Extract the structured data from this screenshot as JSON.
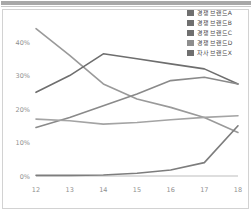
{
  "chart_data": {
    "type": "line",
    "title": "",
    "xlabel": "",
    "ylabel": "",
    "categories": [
      "12",
      "13",
      "14",
      "15",
      "16",
      "17",
      "18"
    ],
    "x_tick_labels": [
      "12",
      "13",
      "14",
      "15",
      "16",
      "17",
      "18"
    ],
    "y_tick_labels": [
      "0%",
      "10%",
      "20%",
      "30%",
      "40%"
    ],
    "y_tick_values": [
      0,
      10,
      20,
      30,
      40
    ],
    "ylim": [
      0,
      46
    ],
    "xlim": [
      12,
      18
    ],
    "grid": false,
    "legend_position": "top-right",
    "series": [
      {
        "name": "경쟁 브랜드A",
        "color": "#9a9a9a",
        "values": [
          44.0,
          36.0,
          27.5,
          23.0,
          20.5,
          17.5,
          13.0
        ]
      },
      {
        "name": "경쟁 브랜드B",
        "color": "#6e6e6e",
        "values": [
          25.0,
          30.0,
          36.5,
          35.0,
          33.5,
          32.0,
          27.5
        ]
      },
      {
        "name": "경쟁 브랜드C",
        "color": "#8a8a8a",
        "values": [
          14.5,
          17.5,
          21.0,
          24.5,
          28.5,
          29.5,
          27.5
        ]
      },
      {
        "name": "경쟁 브랜드D",
        "color": "#a4a4a4",
        "values": [
          17.0,
          16.5,
          15.5,
          16.0,
          16.8,
          17.5,
          18.0
        ]
      },
      {
        "name": "자사 브랜드X",
        "color": "#7d7d7d",
        "values": [
          0.2,
          0.2,
          0.3,
          0.8,
          1.8,
          4.0,
          15.0
        ]
      }
    ]
  },
  "legend": {
    "items": [
      {
        "label": "경쟁 브랜드A",
        "color": "#6f6f6f"
      },
      {
        "label": "경쟁 브랜드B",
        "color": "#6f6f6f"
      },
      {
        "label": "경쟁 브랜드C",
        "color": "#6f6f6f"
      },
      {
        "label": "경쟁 브랜드D",
        "color": "#8d8d8d"
      },
      {
        "label": "자사 브랜드X",
        "color": "#6f6f6f"
      }
    ]
  },
  "axis": {
    "y_labels": [
      "40%",
      "30%",
      "20%",
      "10%",
      "0%"
    ],
    "x_labels": [
      "12",
      "13",
      "14",
      "15",
      "16",
      "17",
      "18"
    ]
  }
}
